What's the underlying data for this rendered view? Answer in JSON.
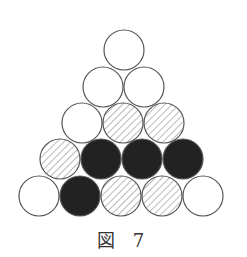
{
  "caption": "図 7",
  "colors": {
    "stroke": "#555555",
    "filled": "#222222",
    "hatch": "#777777",
    "empty": "#ffffff"
  },
  "radius": 20,
  "circles": [
    {
      "row": 1,
      "cx": 124,
      "cy": 50,
      "fill": "empty"
    },
    {
      "row": 2,
      "cx": 103,
      "cy": 87,
      "fill": "empty"
    },
    {
      "row": 2,
      "cx": 144,
      "cy": 87,
      "fill": "empty"
    },
    {
      "row": 3,
      "cx": 82,
      "cy": 123,
      "fill": "empty"
    },
    {
      "row": 3,
      "cx": 123,
      "cy": 123,
      "fill": "hatched"
    },
    {
      "row": 3,
      "cx": 164,
      "cy": 123,
      "fill": "hatched"
    },
    {
      "row": 4,
      "cx": 60,
      "cy": 159,
      "fill": "hatched"
    },
    {
      "row": 4,
      "cx": 101,
      "cy": 159,
      "fill": "filled"
    },
    {
      "row": 4,
      "cx": 142,
      "cy": 159,
      "fill": "filled"
    },
    {
      "row": 4,
      "cx": 183,
      "cy": 159,
      "fill": "filled"
    },
    {
      "row": 5,
      "cx": 39,
      "cy": 196,
      "fill": "empty"
    },
    {
      "row": 5,
      "cx": 80,
      "cy": 196,
      "fill": "filled"
    },
    {
      "row": 5,
      "cx": 121,
      "cy": 196,
      "fill": "hatched"
    },
    {
      "row": 5,
      "cx": 162,
      "cy": 196,
      "fill": "hatched"
    },
    {
      "row": 5,
      "cx": 203,
      "cy": 196,
      "fill": "empty"
    }
  ]
}
